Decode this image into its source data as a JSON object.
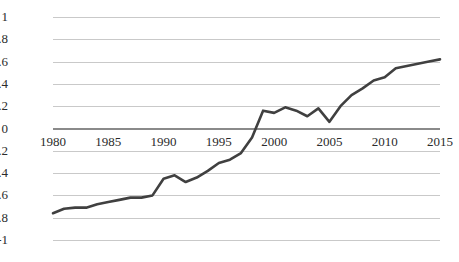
{
  "chart_data": {
    "type": "line",
    "title": "",
    "subtitle": "",
    "xlabel": "",
    "ylabel": "",
    "xlim": [
      1980,
      2015
    ],
    "ylim": [
      -1,
      1
    ],
    "grid": true,
    "legend": false,
    "legend_position": "none",
    "line_color": "#404040",
    "gridline_color": "#c9c9c9",
    "zero_line_color": "#8a8a8a",
    "background_color": "#ffffff",
    "xticks": [
      1980,
      1985,
      1990,
      1995,
      2000,
      2005,
      2010,
      2015
    ],
    "xtick_labels": [
      "1980",
      "1985",
      "1990",
      "1995",
      "2000",
      "2005",
      "2010",
      "2015"
    ],
    "yticks": [
      1,
      0.8,
      0.6,
      0.4,
      0.2,
      0,
      -0.2,
      -0.4,
      -0.6,
      -0.8,
      -1
    ],
    "ytick_labels": [
      "1",
      "0.8",
      "0.6",
      "0.4",
      "0.2",
      "0",
      "-0.2",
      "-0.4",
      "-0.6",
      "-0.8",
      "-1"
    ],
    "x": [
      1980,
      1981,
      1982,
      1983,
      1984,
      1985,
      1986,
      1987,
      1988,
      1989,
      1990,
      1991,
      1992,
      1993,
      1994,
      1995,
      1996,
      1997,
      1998,
      1999,
      2000,
      2001,
      2002,
      2003,
      2004,
      2005,
      2006,
      2007,
      2008,
      2009,
      2010,
      2011,
      2012,
      2013,
      2014,
      2015
    ],
    "values": [
      -0.76,
      -0.72,
      -0.71,
      -0.71,
      -0.68,
      -0.66,
      -0.64,
      -0.62,
      -0.62,
      -0.6,
      -0.45,
      -0.42,
      -0.48,
      -0.44,
      -0.38,
      -0.31,
      -0.28,
      -0.22,
      -0.08,
      0.16,
      0.14,
      0.19,
      0.16,
      0.11,
      0.18,
      0.06,
      0.2,
      0.3,
      0.36,
      0.43,
      0.46,
      0.54,
      0.56,
      0.58,
      0.6,
      0.62
    ],
    "series": [
      {
        "name": "",
        "values": [
          -0.76,
          -0.72,
          -0.71,
          -0.71,
          -0.68,
          -0.66,
          -0.64,
          -0.62,
          -0.62,
          -0.6,
          -0.45,
          -0.42,
          -0.48,
          -0.44,
          -0.38,
          -0.31,
          -0.28,
          -0.22,
          -0.08,
          0.16,
          0.14,
          0.19,
          0.16,
          0.11,
          0.18,
          0.06,
          0.2,
          0.3,
          0.36,
          0.43,
          0.46,
          0.54,
          0.56,
          0.58,
          0.6,
          0.62
        ]
      }
    ],
    "annotations": []
  }
}
